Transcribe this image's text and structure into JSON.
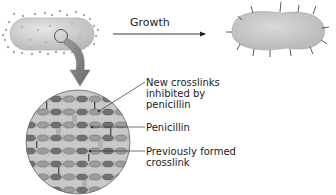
{
  "diagram": {
    "arrow_label": "Growth",
    "labels": {
      "new_crosslinks": [
        "New crosslinks",
        "inhibited by",
        "penicillin"
      ],
      "penicillin": "Penicillin",
      "previous_crosslink": [
        "Previously formed",
        "crosslink"
      ]
    },
    "colors": {
      "cell_fill": "#cfcfcf",
      "dots": "#a8a8a8",
      "hex_dark": "#6e6e6e",
      "hex_light": "#9a9a9a",
      "band": "#bdbdbd",
      "circle_bg": "#c8c8c8",
      "text": "#222222"
    }
  }
}
